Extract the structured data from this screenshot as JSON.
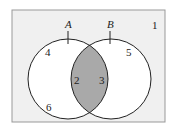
{
  "diagram": {
    "type": "venn",
    "universe_label": "1",
    "sets": [
      {
        "name": "A",
        "label": "A"
      },
      {
        "name": "B",
        "label": "B"
      }
    ],
    "regions": {
      "a_only_top": "4",
      "a_only_bottom": "6",
      "intersection_left": "2",
      "intersection_right": "3",
      "b_only": "5"
    },
    "shaded_region": "A ∩ B",
    "colors": {
      "background": "#f0f0f0",
      "circle_fill": "#ffffff",
      "shade": "#a9a9a9",
      "stroke": "#222222"
    }
  }
}
